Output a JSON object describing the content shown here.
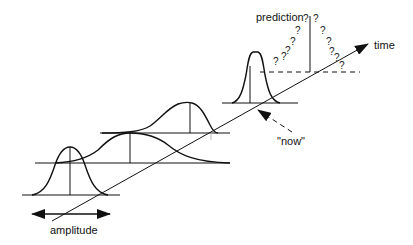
{
  "labels": {
    "time": "time",
    "prediction": "prediction",
    "now": "\"now\"",
    "amplitude": "amplitude"
  },
  "question_marks": [
    "?",
    "?",
    "?",
    "?",
    "?",
    "?",
    "?",
    "?",
    "?",
    "?",
    "?",
    "?"
  ],
  "colors": {
    "stroke": "#111111",
    "background": "#ffffff"
  }
}
